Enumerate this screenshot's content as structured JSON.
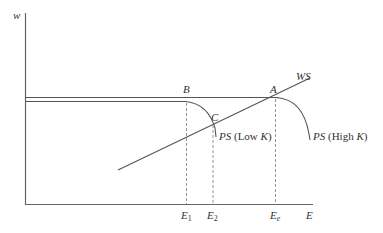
{
  "axes": {
    "y_label": "w",
    "x_label": "E"
  },
  "points": {
    "A": "A",
    "B": "B",
    "C": "C"
  },
  "curves": {
    "ws": "WS",
    "ps_low_prefix": "PS",
    "ps_low_suffix": "(Low ",
    "ps_low_k": "K",
    "ps_low_close": ")",
    "ps_high_prefix": "PS",
    "ps_high_suffix": "(High ",
    "ps_high_k": "K",
    "ps_high_close": ")"
  },
  "ticks": {
    "e1_base": "E",
    "e1_sub": "1",
    "e2_base": "E",
    "e2_sub": "2",
    "ee_base": "E",
    "ee_sub": "e"
  },
  "colors": {
    "line": "#555555",
    "dashed": "#888888",
    "text": "#333333"
  }
}
